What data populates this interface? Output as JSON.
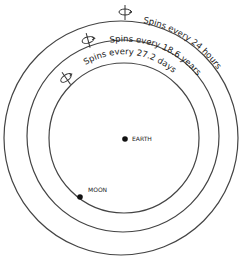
{
  "diagram": {
    "orbits": [
      {
        "id": "outer",
        "label": "Spins every 24 hours"
      },
      {
        "id": "middle",
        "label": "Spins every 18.6 years"
      },
      {
        "id": "inner",
        "label": "Spins every 27.2 days"
      }
    ],
    "bodies": [
      {
        "id": "earth",
        "label": "EARTH"
      },
      {
        "id": "moon",
        "label": "MOON"
      }
    ],
    "colors": {
      "line": "#333333",
      "background": "#ffffff"
    }
  }
}
